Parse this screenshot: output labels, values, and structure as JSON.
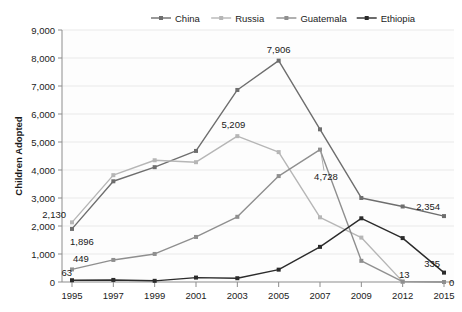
{
  "chart_data": {
    "type": "line",
    "title": "",
    "subtitle": "",
    "xlabel": "",
    "ylabel": "Children Adopted",
    "categories": [
      "1995",
      "1997",
      "1999",
      "2001",
      "2003",
      "2005",
      "2007",
      "2009",
      "2012",
      "2015"
    ],
    "ylim": [
      0,
      9000
    ],
    "ytick_labels": [
      "0",
      "1,000",
      "2,000",
      "3,000",
      "4,000",
      "5,000",
      "6,000",
      "7,000",
      "8,000",
      "9,000"
    ],
    "ytick_values": [
      0,
      1000,
      2000,
      3000,
      4000,
      5000,
      6000,
      7000,
      8000,
      9000
    ],
    "grid": true,
    "legend_position": "top",
    "series": [
      {
        "name": "China",
        "color": "#6e6e6e",
        "values": [
          1896,
          3597,
          4101,
          4681,
          6859,
          7906,
          5453,
          3001,
          2697,
          2354
        ]
      },
      {
        "name": "Russia",
        "color": "#b6b6b6",
        "values": [
          2130,
          3816,
          4348,
          4279,
          5209,
          4639,
          2310,
          1586,
          13,
          0
        ]
      },
      {
        "name": "Guatemala",
        "color": "#8f8f8f",
        "values": [
          449,
          788,
          1002,
          1609,
          2328,
          3783,
          4728,
          756,
          13,
          0
        ]
      },
      {
        "name": "Ethiopia",
        "color": "#2b2b2b",
        "values": [
          63,
          74,
          42,
          158,
          135,
          441,
          1255,
          2275,
          1568,
          335
        ]
      }
    ],
    "point_labels": [
      {
        "text": "2,130",
        "series": "Russia",
        "category": "1995",
        "anchor": "end",
        "dx": -6,
        "dy": -4
      },
      {
        "text": "1,896",
        "series": "China",
        "category": "1995",
        "anchor": "start",
        "dx": -2,
        "dy": 16
      },
      {
        "text": "449",
        "series": "Guatemala",
        "category": "1995",
        "anchor": "start",
        "dx": 1,
        "dy": -7
      },
      {
        "text": "63",
        "series": "Ethiopia",
        "category": "1995",
        "anchor": "end",
        "dx": 0,
        "dy": -4
      },
      {
        "text": "5,209",
        "series": "Russia",
        "category": "2003",
        "anchor": "middle",
        "dx": -4,
        "dy": -8
      },
      {
        "text": "7,906",
        "series": "China",
        "category": "2005",
        "anchor": "middle",
        "dx": 0,
        "dy": -8
      },
      {
        "text": "4,728",
        "series": "Guatemala",
        "category": "2007",
        "anchor": "middle",
        "dx": 6,
        "dy": 30,
        "leader": true
      },
      {
        "text": "2,354",
        "series": "China",
        "category": "2015",
        "anchor": "end",
        "dx": -4,
        "dy": -6
      },
      {
        "text": "335",
        "series": "Ethiopia",
        "category": "2015",
        "anchor": "end",
        "dx": -4,
        "dy": -6
      },
      {
        "text": "13",
        "series": "Russia",
        "category": "2012",
        "anchor": "end",
        "dx": 7,
        "dy": -4
      },
      {
        "text": "0",
        "series": "Russia",
        "category": "2015",
        "anchor": "start",
        "dx": 5,
        "dy": 4
      }
    ]
  },
  "legend": {
    "items": [
      {
        "label": "China",
        "color": "#6e6e6e"
      },
      {
        "label": "Russia",
        "color": "#b6b6b6"
      },
      {
        "label": "Guatemala",
        "color": "#8f8f8f"
      },
      {
        "label": "Ethiopia",
        "color": "#2b2b2b"
      }
    ]
  }
}
